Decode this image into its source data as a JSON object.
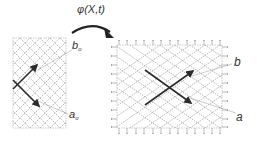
{
  "mapping_label": "φ(X,t)",
  "reference": {
    "label_b": "b",
    "label_b_sub": "o",
    "label_a": "a",
    "label_a_sub": "o"
  },
  "deformed": {
    "label_b": "b",
    "label_a": "a"
  },
  "colors": {
    "grid": "#8a8a8a",
    "arrow": "#2b2b2b",
    "text": "#333333",
    "leader": "#9a9a9a"
  }
}
